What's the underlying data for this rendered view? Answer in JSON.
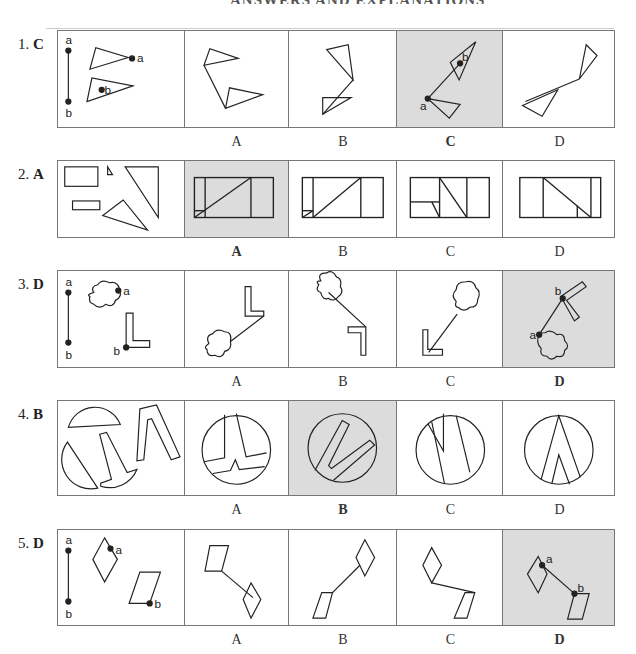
{
  "header": {
    "title_fragment": "ANSWERS AND EXPLANATIONS"
  },
  "columns": {
    "widths": [
      127,
      105,
      108,
      107,
      111
    ]
  },
  "colors": {
    "selected_bg": "#dcdcdc",
    "stroke": "#222222",
    "border": "#777777"
  },
  "questions": [
    {
      "number": "1.",
      "answer": "C",
      "options": [
        "A",
        "B",
        "C",
        "D"
      ],
      "selected_index": 2,
      "figure_labels": [
        "a",
        "b",
        "a",
        "b",
        "b",
        "a"
      ]
    },
    {
      "number": "2.",
      "answer": "A",
      "options": [
        "A",
        "B",
        "C",
        "D"
      ],
      "selected_index": 0
    },
    {
      "number": "3.",
      "answer": "D",
      "options": [
        "A",
        "B",
        "C",
        "D"
      ],
      "selected_index": 3,
      "figure_labels": [
        "a",
        "b",
        "a",
        "b",
        "b",
        "a"
      ]
    },
    {
      "number": "4.",
      "answer": "B",
      "options": [
        "A",
        "B",
        "C",
        "D"
      ],
      "selected_index": 1
    },
    {
      "number": "5.",
      "answer": "D",
      "options": [
        "A",
        "B",
        "C",
        "D"
      ],
      "selected_index": 3,
      "figure_labels": [
        "a",
        "b",
        "a",
        "b",
        "a",
        "b"
      ]
    }
  ]
}
